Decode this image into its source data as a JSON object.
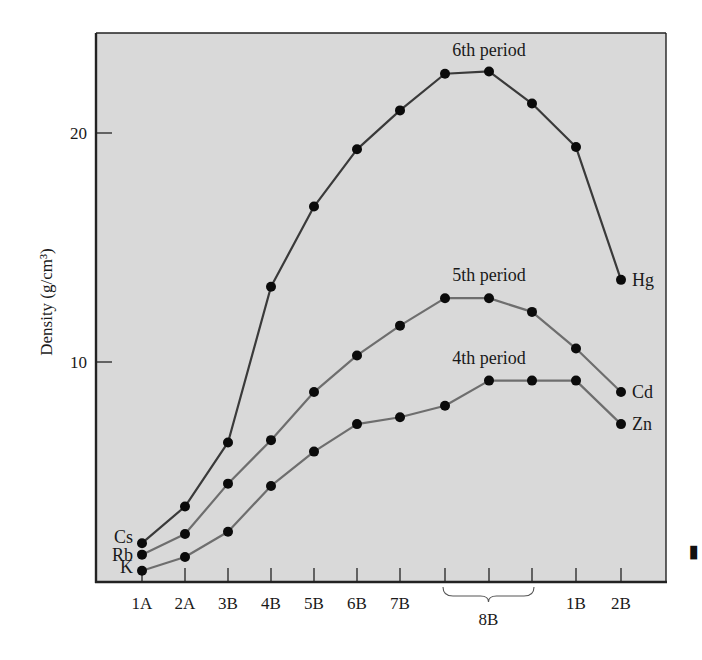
{
  "chart_data": {
    "type": "line",
    "title": "",
    "xlabel": "",
    "ylabel": "Density (g/cm³)",
    "ylim": [
      0,
      24
    ],
    "yticks": [
      10,
      20
    ],
    "grid": false,
    "categories": [
      "1A",
      "2A",
      "3B",
      "4B",
      "5B",
      "6B",
      "7B",
      "8B",
      "8B",
      "8B",
      "1B",
      "2B"
    ],
    "tick_labels": [
      "1A",
      "2A",
      "3B",
      "4B",
      "5B",
      "6B",
      "7B",
      "",
      "",
      "",
      "1B",
      "2B"
    ],
    "group_label": {
      "text": "8B",
      "from_index": 7,
      "to_index": 9
    },
    "series": [
      {
        "name": "6th period",
        "color": "#3a3a3a",
        "values": [
          2.0,
          3.6,
          6.4,
          13.2,
          16.7,
          19.2,
          20.9,
          22.5,
          22.6,
          21.2,
          19.3,
          13.5
        ],
        "start_label": "Cs",
        "end_label": "Hg"
      },
      {
        "name": "5th period",
        "color": "#6e6e6e",
        "values": [
          1.5,
          2.4,
          4.6,
          6.5,
          8.6,
          10.2,
          11.5,
          12.7,
          12.7,
          12.1,
          10.5,
          8.6
        ],
        "start_label": "Rb",
        "end_label": "Cd"
      },
      {
        "name": "4th period",
        "color": "#6e6e6e",
        "values": [
          0.8,
          1.4,
          2.5,
          4.5,
          6.0,
          7.2,
          7.5,
          8.0,
          9.1,
          9.1,
          9.1,
          7.2
        ],
        "start_label": "K",
        "end_label": "Zn"
      }
    ],
    "annotations": [
      {
        "text": "6th period",
        "near_index": 8,
        "series": 0
      },
      {
        "text": "5th period",
        "near_index": 8,
        "series": 1
      },
      {
        "text": "4th period",
        "near_index": 8,
        "series": 2
      }
    ],
    "legend": null
  },
  "colors": {
    "plot_background": "#d9d9d9",
    "frame": "#222222",
    "points": "#0b0b0b"
  }
}
